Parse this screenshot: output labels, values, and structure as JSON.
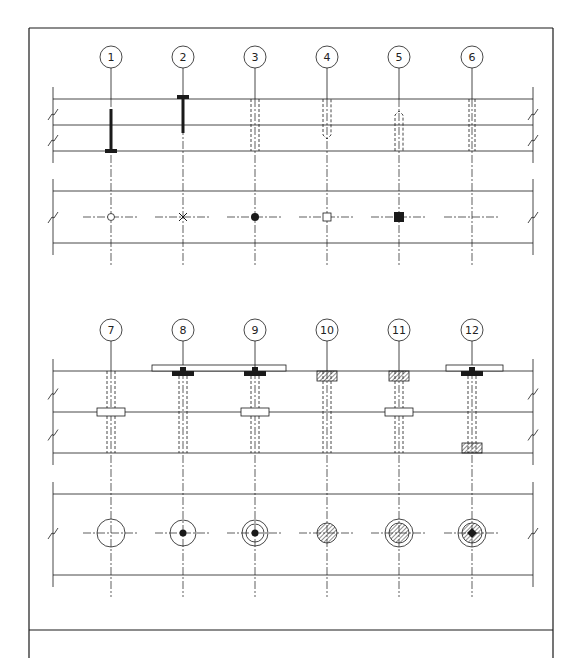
{
  "drawing": {
    "title": "Fastener / bolt symbol detail sheet",
    "line_color": "#1a1a1a",
    "background": "#ffffff",
    "frame": {
      "left": 29,
      "right": 553,
      "top": 28,
      "divider_y": 630
    },
    "top_row": {
      "columns_x": [
        111,
        183,
        255,
        327,
        399,
        472
      ],
      "labels": [
        "1",
        "2",
        "3",
        "4",
        "5",
        "6"
      ],
      "label_y": 57,
      "elevation_lines_y": [
        99,
        125,
        151
      ],
      "plan_lines_y": [
        191,
        243
      ],
      "plan_center_y": 217,
      "plan_symbols": [
        "open-circle",
        "cross-x",
        "filled-dot",
        "open-square",
        "filled-square",
        "none"
      ]
    },
    "bottom_row": {
      "columns_x": [
        111,
        183,
        255,
        327,
        399,
        472
      ],
      "labels": [
        "7",
        "8",
        "9",
        "10",
        "11",
        "12"
      ],
      "label_y": 330,
      "elevation_lines_y": [
        371,
        412,
        453
      ],
      "plan_lines_y": [
        494,
        575
      ],
      "plan_center_y": 533,
      "plan_symbols": [
        "large-circle",
        "circle-with-dot",
        "double-circle-with-dot",
        "hatched-disk",
        "ring-with-hatched-disk",
        "ring-hatched-disk-dot"
      ]
    }
  }
}
